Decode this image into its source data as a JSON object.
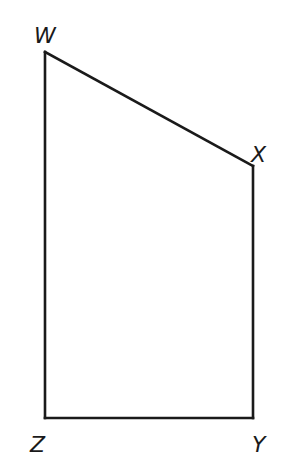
{
  "figure": {
    "shape": "quadrilateral",
    "stroke_color": "#1a1a1a",
    "background": "#ffffff",
    "vertices": [
      {
        "name": "W",
        "x": 45,
        "y": 52,
        "label_x": 34,
        "label_y": 43
      },
      {
        "name": "X",
        "x": 253,
        "y": 166,
        "label_x": 251,
        "label_y": 162
      },
      {
        "name": "Y",
        "x": 253,
        "y": 418,
        "label_x": 252,
        "label_y": 452
      },
      {
        "name": "Z",
        "x": 45,
        "y": 418,
        "label_x": 30,
        "label_y": 452
      }
    ],
    "edges": [
      {
        "from": "W",
        "to": "X"
      },
      {
        "from": "X",
        "to": "Y"
      },
      {
        "from": "Y",
        "to": "Z"
      },
      {
        "from": "Z",
        "to": "W"
      }
    ]
  }
}
